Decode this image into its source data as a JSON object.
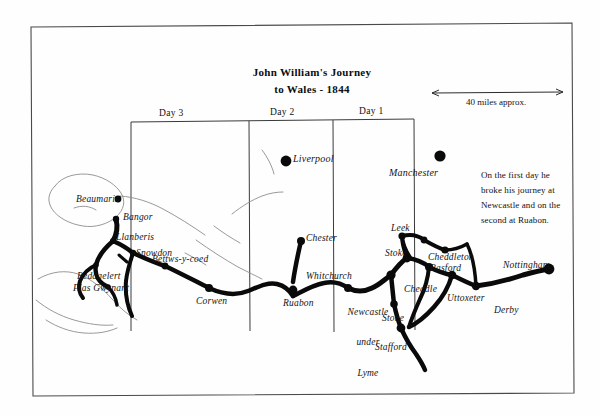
{
  "map": {
    "title_line1": "John William's Journey",
    "title_line2": "to Wales - 1844",
    "scale_label": "40 miles approx.",
    "note": "On the first day he broke his journey at Newcastle and on the second at Ruabon.",
    "note_lines": [
      "On the first day he",
      "broke his journey at",
      "Newcastle and on the",
      "second at Ruabon."
    ],
    "day_columns": [
      {
        "label": "Day 3"
      },
      {
        "label": "Day 2"
      },
      {
        "label": "Day 1"
      }
    ],
    "places": [
      {
        "name": "Beaumaris",
        "type": "town"
      },
      {
        "name": "Bangor",
        "type": "town"
      },
      {
        "name": "Llanberis",
        "type": "town"
      },
      {
        "name": "Snowdon",
        "type": "peak"
      },
      {
        "name": "Beddgelert",
        "type": "town"
      },
      {
        "name": "Plas Gwynant",
        "type": "town"
      },
      {
        "name": "Bettws-y-coed",
        "type": "town"
      },
      {
        "name": "Corwen",
        "type": "town"
      },
      {
        "name": "Liverpool",
        "type": "city"
      },
      {
        "name": "Chester",
        "type": "town"
      },
      {
        "name": "Ruabon",
        "type": "town"
      },
      {
        "name": "Whitchurch",
        "type": "town"
      },
      {
        "name": "Newcastle under Lyme",
        "type": "town"
      },
      {
        "name": "Stoke",
        "type": "town"
      },
      {
        "name": "Manchester",
        "type": "city"
      },
      {
        "name": "Leek",
        "type": "town"
      },
      {
        "name": "Cheddleton",
        "type": "town"
      },
      {
        "name": "Basford",
        "type": "town"
      },
      {
        "name": "Cheadle",
        "type": "town"
      },
      {
        "name": "Uttoxeter",
        "type": "town"
      },
      {
        "name": "Stone",
        "type": "town"
      },
      {
        "name": "Stafford",
        "type": "town"
      },
      {
        "name": "Derby",
        "type": "town"
      },
      {
        "name": "Nottingham",
        "type": "city"
      }
    ],
    "newcastle_lines": [
      "Newcastle",
      "under",
      "Lyme"
    ],
    "colors": {
      "ink": "#111111",
      "route": "#0a0a0a",
      "coastline": "#8d8d8d",
      "frame": "#4a4a4a",
      "paper": "#fefefe"
    }
  }
}
